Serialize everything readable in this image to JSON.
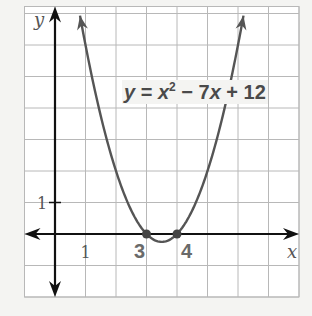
{
  "chart_data": {
    "type": "line",
    "title": "",
    "equation": "y = x² − 7x + 12",
    "equation_parts": {
      "lhs": "y",
      "eq": " = ",
      "x1": "x",
      "exp": "2",
      "rest1": " − 7",
      "x2": "x",
      "rest2": " + 12"
    },
    "xlabel": "x",
    "ylabel": "y",
    "xlim": [
      -1,
      8
    ],
    "ylim": [
      -2,
      7
    ],
    "grid": true,
    "x_tick_labels": [
      {
        "value": 1,
        "label": "1"
      },
      {
        "value": 3,
        "label": "3",
        "bold": true
      },
      {
        "value": 4,
        "label": "4",
        "bold": true
      }
    ],
    "y_tick_labels": [
      {
        "value": 1,
        "label": "1"
      }
    ],
    "series": [
      {
        "name": "y = x^2 - 7x + 12",
        "function": "x^2 - 7x + 12",
        "x_range": [
          0.82,
          6.18
        ],
        "color": "#555555",
        "x": [
          1,
          2,
          3,
          3.5,
          4,
          5,
          6
        ],
        "values": [
          6,
          2,
          0,
          -0.25,
          0,
          2,
          6
        ]
      }
    ],
    "marked_points": [
      {
        "x": 3,
        "y": 0
      },
      {
        "x": 4,
        "y": 0
      }
    ],
    "colors": {
      "grid": "#b8b8b8",
      "axis": "#111111",
      "curve": "#555555",
      "point": "#444444",
      "background": "#f4f4f2",
      "label": "#555555"
    }
  }
}
